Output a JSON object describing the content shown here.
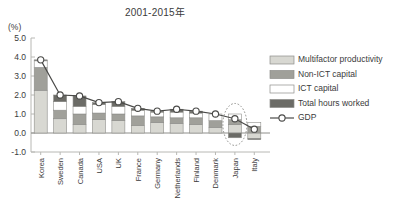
{
  "title": "2001-2015年",
  "axis": {
    "unit_label": "(%)",
    "yticks": [
      "5.0",
      "4.0",
      "3.0",
      "2.0",
      "1.0",
      "0.0",
      "-1.0"
    ]
  },
  "legend": {
    "items": [
      {
        "label": "Multifactor productivity",
        "key": "mfp",
        "color": "#d8d8d2"
      },
      {
        "label": "Non-ICT capital",
        "key": "nonict",
        "color": "#a0a09a"
      },
      {
        "label": "ICT capital",
        "key": "ict",
        "color": "#ffffff"
      },
      {
        "label": "Total hours worked",
        "key": "hours",
        "color": "#6b6b66"
      },
      {
        "label": "GDP",
        "key": "gdp",
        "color": "#ffffff"
      }
    ]
  },
  "annotation": {
    "name": "highlight-ellipse",
    "target": "Japan"
  },
  "chart_data": {
    "type": "bar",
    "stacked": true,
    "title": "2001-2015年",
    "xlabel": "",
    "ylabel": "(%)",
    "ylim": [
      -1.0,
      5.0
    ],
    "ytick_step": 1.0,
    "grid": false,
    "legend_position": "right",
    "categories": [
      "Korea",
      "Sweden",
      "Canada",
      "USA",
      "UK",
      "France",
      "Germany",
      "Netherlands",
      "Finland",
      "Denmark",
      "Japan",
      "Italy"
    ],
    "series": [
      {
        "name": "Multifactor productivity",
        "color": "#d8d8d2",
        "values": [
          2.25,
          0.75,
          0.45,
          0.7,
          0.65,
          0.4,
          0.55,
          0.5,
          0.45,
          0.3,
          0.45,
          -0.3
        ]
      },
      {
        "name": "Non-ICT capital",
        "color": "#a0a09a",
        "values": [
          1.2,
          0.45,
          0.55,
          0.35,
          0.35,
          0.5,
          0.3,
          0.3,
          0.35,
          0.35,
          0.25,
          0.35
        ]
      },
      {
        "name": "ICT capital",
        "color": "#ffffff",
        "values": [
          0.35,
          0.45,
          0.4,
          0.45,
          0.4,
          0.3,
          0.25,
          0.3,
          0.25,
          0.35,
          0.3,
          0.2
        ]
      },
      {
        "name": "Total hours worked",
        "color": "#6b6b66",
        "values": [
          0.05,
          0.35,
          0.55,
          0.1,
          0.25,
          0.1,
          0.05,
          0.15,
          0.1,
          0.0,
          -0.25,
          -0.05
        ]
      }
    ],
    "gdp_line": {
      "name": "GDP",
      "marker": "circle",
      "color": "#ffffff",
      "line_color": "#4a4a48",
      "values": [
        3.85,
        2.0,
        1.95,
        1.6,
        1.65,
        1.3,
        1.15,
        1.25,
        1.15,
        1.0,
        0.75,
        0.2
      ]
    }
  }
}
